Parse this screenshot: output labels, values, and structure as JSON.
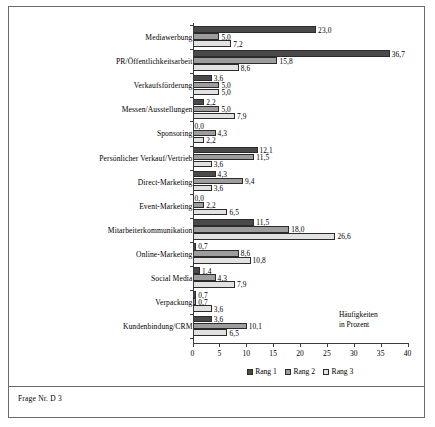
{
  "figure": {
    "footer_note": "Frage Nr. D 3"
  },
  "chart_data": {
    "type": "bar",
    "orientation": "horizontal",
    "title": "",
    "xlabel": "Häufigkeiten in Prozent",
    "xlabel_lines": [
      "Häufigkeiten",
      "in Prozent"
    ],
    "ylabel": "",
    "xlim": [
      0,
      40
    ],
    "xticks": [
      0,
      5,
      10,
      15,
      20,
      25,
      30,
      35,
      40
    ],
    "xticklabels": [
      "0",
      "5",
      "10",
      "15",
      "20",
      "25",
      "30",
      "35",
      "40"
    ],
    "grid": false,
    "legend_position": "bottom",
    "categories": [
      "Mediawerbung",
      "PR/Öffentlichkeitsarbeit",
      "Verkaufsförderung",
      "Messen/Ausstellungen",
      "Sponsoring",
      "Persönlicher Verkauf/Vertrieb",
      "Direct-Marketing",
      "Event-Marketing",
      "Mitarbeiterkommunikation",
      "Online-Marketing",
      "Social Media",
      "Verpackung",
      "Kundenbindung/CRM"
    ],
    "series": [
      {
        "name": "Rang 1",
        "color": "#4a4a4a",
        "values": [
          23.0,
          36.7,
          3.6,
          2.2,
          0.0,
          12.1,
          4.3,
          0.0,
          11.5,
          0.7,
          1.4,
          0.7,
          3.6
        ],
        "labels": [
          "23,0",
          "36,7",
          "3,6",
          "2,2",
          "0,0",
          "12,1",
          "4,3",
          "0,0",
          "11,5",
          "0,7",
          "1,4",
          "0,7",
          "3,6"
        ]
      },
      {
        "name": "Rang 2",
        "color": "#9d9d9d",
        "values": [
          5.0,
          15.8,
          5.0,
          5.0,
          4.3,
          11.5,
          9.4,
          2.2,
          18.0,
          8.6,
          4.3,
          0.7,
          10.1
        ],
        "labels": [
          "5,0",
          "15,8",
          "5,0",
          "5,0",
          "4,3",
          "11,5",
          "9,4",
          "2,2",
          "18,0",
          "8,6",
          "4,3",
          "0,7",
          "10,1"
        ]
      },
      {
        "name": "Rang 3",
        "color": "#e2e2e2",
        "values": [
          7.2,
          8.6,
          5.0,
          7.9,
          2.2,
          3.6,
          3.6,
          6.5,
          26.6,
          10.8,
          7.9,
          3.6,
          6.5
        ],
        "labels": [
          "7,2",
          "8,6",
          "5,0",
          "7,9",
          "2,2",
          "3,6",
          "3,6",
          "6,5",
          "26,6",
          "10,8",
          "7,9",
          "3,6",
          "6,5"
        ]
      }
    ]
  }
}
